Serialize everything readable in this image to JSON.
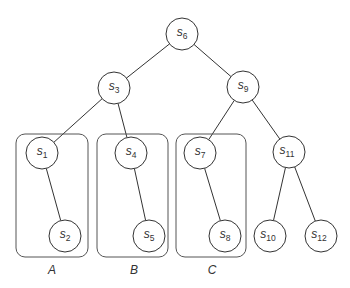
{
  "diagram": {
    "type": "binary-tree",
    "nodes": [
      {
        "id": "s6",
        "base": "s",
        "sub": "6",
        "x": 182,
        "y": 34
      },
      {
        "id": "s3",
        "base": "s",
        "sub": "3",
        "x": 114,
        "y": 88
      },
      {
        "id": "s9",
        "base": "s",
        "sub": "9",
        "x": 243,
        "y": 87
      },
      {
        "id": "s1",
        "base": "s",
        "sub": "1",
        "x": 42,
        "y": 153
      },
      {
        "id": "s2",
        "base": "s",
        "sub": "2",
        "x": 65,
        "y": 236
      },
      {
        "id": "s4",
        "base": "s",
        "sub": "4",
        "x": 131,
        "y": 153
      },
      {
        "id": "s5",
        "base": "s",
        "sub": "5",
        "x": 149,
        "y": 236
      },
      {
        "id": "s7",
        "base": "s",
        "sub": "7",
        "x": 200,
        "y": 153
      },
      {
        "id": "s8",
        "base": "s",
        "sub": "8",
        "x": 225,
        "y": 236
      },
      {
        "id": "s11",
        "base": "s",
        "sub": "11",
        "x": 289,
        "y": 152
      },
      {
        "id": "s10",
        "base": "s",
        "sub": "10",
        "x": 270,
        "y": 236
      },
      {
        "id": "s12",
        "base": "s",
        "sub": "12",
        "x": 321,
        "y": 236
      }
    ],
    "edges": [
      [
        "s6",
        "s3"
      ],
      [
        "s6",
        "s9"
      ],
      [
        "s3",
        "s1"
      ],
      [
        "s3",
        "s4"
      ],
      [
        "s9",
        "s7"
      ],
      [
        "s9",
        "s11"
      ],
      [
        "s1",
        "s2"
      ],
      [
        "s4",
        "s5"
      ],
      [
        "s7",
        "s8"
      ],
      [
        "s11",
        "s10"
      ],
      [
        "s11",
        "s12"
      ]
    ],
    "groups": [
      {
        "label": "A",
        "x": 16,
        "y": 134,
        "w": 72,
        "h": 123,
        "label_x": 52,
        "label_y": 274
      },
      {
        "label": "B",
        "x": 97,
        "y": 134,
        "w": 71,
        "h": 123,
        "label_x": 134,
        "label_y": 274
      },
      {
        "label": "C",
        "x": 176,
        "y": 134,
        "w": 70,
        "h": 123,
        "label_x": 212,
        "label_y": 274
      }
    ],
    "node_radius": 16
  }
}
